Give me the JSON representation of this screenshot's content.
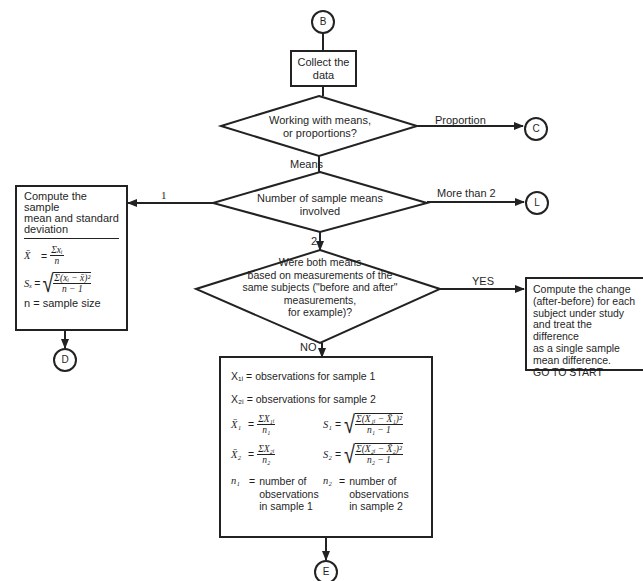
{
  "connectors": {
    "start": "B",
    "proportion": "C",
    "more_than_two": "L",
    "one_mean": "D",
    "two_means_independent": "E"
  },
  "steps": {
    "collect": {
      "line1": "Collect the",
      "line2": "data"
    }
  },
  "decisions": {
    "means_or_proportions": {
      "line1": "Working with means,",
      "line2": "or proportions?",
      "branch_right": "Proportion",
      "branch_down": "Means"
    },
    "number_of_means": {
      "line1": "Number of sample means",
      "line2": "involved",
      "branch_left": "1",
      "branch_right": "More than 2",
      "branch_down": "2"
    },
    "paired": {
      "line1": "Were both means",
      "line2": "based on measurements of the",
      "line3": "same subjects (\"before and after\"",
      "line4": "measurements,",
      "line5": "for example)?",
      "branch_right": "YES",
      "branch_down": "NO"
    }
  },
  "single_mean_box": {
    "title_line1": "Compute the sample",
    "title_line2": "mean and standard",
    "title_line3": "deviation",
    "mean_lhs": "X̄",
    "mean_num": "Σxᵢ",
    "mean_den": "n",
    "sd_lhs": "Sₓ",
    "sd_num": "Σ(xᵢ − x̄)²",
    "sd_den": "n − 1",
    "n_def": "n = sample size"
  },
  "paired_box": {
    "line1": "Compute the change",
    "line2": "(after-before) for each",
    "line3": "subject under study",
    "line4": "and treat the difference",
    "line5": "as a single sample",
    "line6": "mean difference.",
    "line7": "GO TO START"
  },
  "two_sample_box": {
    "x1_def": "X₁ᵢ = observations for sample 1",
    "x2_def": "X₂ᵢ = observations for sample 2",
    "mean1_lhs": "X̄₁",
    "mean1_num": "ΣX₁ᵢ",
    "mean1_den": "n₁",
    "sd1_lhs": "S₁",
    "sd1_num": "Σ(X₁ᵢ − X̄₁)²",
    "sd1_den": "n₁ − 1",
    "mean2_lhs": "X̄₂",
    "mean2_num": "ΣX₂ᵢ",
    "mean2_den": "n₂",
    "sd2_lhs": "S₂",
    "sd2_num": "Σ(X₂ᵢ − X̄₂)²",
    "sd2_den": "n₂ − 1",
    "n1_lhs": "n₁",
    "n1_l1": "number of",
    "n1_l2": "observations",
    "n1_l3": "in sample 1",
    "n2_lhs": "n₂",
    "n2_l1": "number of",
    "n2_l2": "observations",
    "n2_l3": "in sample 2"
  },
  "eq": "="
}
